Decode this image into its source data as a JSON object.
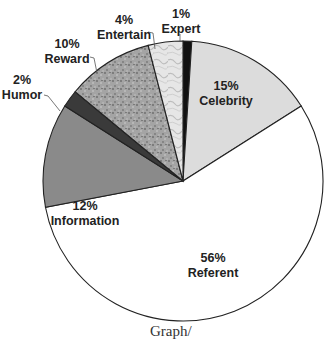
{
  "chart_data": {
    "type": "pie",
    "title": "",
    "start_angle_deg": -90,
    "direction": "clockwise",
    "slices": [
      {
        "label": "Expert",
        "value": 1,
        "pct_label": "1%",
        "fill": "#111111",
        "label_pos": [
          181,
          18
        ],
        "leader": [
          [
            180,
            34
          ],
          [
            180,
            41
          ]
        ]
      },
      {
        "label": "Celebrity",
        "value": 15,
        "pct_label": "15%",
        "fill": "#dcdcdc",
        "label_pos": [
          226,
          90
        ]
      },
      {
        "label": "Referent",
        "value": 56,
        "pct_label": "56%",
        "fill": "#ffffff",
        "label_pos": [
          213,
          262
        ]
      },
      {
        "label": "Information",
        "value": 12,
        "pct_label": "12%",
        "fill": "#8a8a8a",
        "label_pos": [
          85,
          210
        ]
      },
      {
        "label": "Humor",
        "value": 2,
        "pct_label": "2%",
        "fill": "#3a3a3a",
        "label_pos": [
          22,
          84
        ],
        "leader": [
          [
            44,
            95
          ],
          [
            48,
            96
          ],
          [
            60,
            111
          ]
        ]
      },
      {
        "label": "Reward",
        "value": 10,
        "pct_label": "10%",
        "fill": "#9c9c9c",
        "pattern": "speckle",
        "label_pos": [
          67,
          48
        ],
        "leader": [
          [
            90,
            57
          ],
          [
            94,
            58
          ],
          [
            97,
            73
          ]
        ]
      },
      {
        "label": "Entertain",
        "value": 4,
        "pct_label": "4%",
        "fill": "#e2e2e2",
        "pattern": "marble",
        "label_pos": [
          124,
          24
        ],
        "leader": [
          [
            148,
            32
          ],
          [
            153,
            33
          ],
          [
            155,
            49
          ]
        ]
      }
    ],
    "legend": null
  },
  "caption": "Graph/"
}
